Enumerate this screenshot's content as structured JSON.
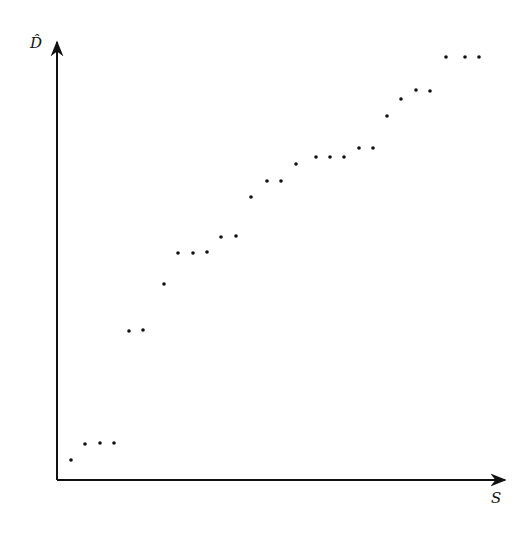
{
  "chart_data": {
    "type": "scatter",
    "title": "",
    "xlabel": "S",
    "ylabel": "D̂",
    "grid": false,
    "legend": null,
    "ticks": "none",
    "axis_pixel_frame": {
      "x0": 57,
      "y0": 480,
      "x_end": 507,
      "y_end": 40
    },
    "points_px": [
      [
        71,
        460
      ],
      [
        85,
        444
      ],
      [
        100,
        443
      ],
      [
        114,
        443
      ],
      [
        129,
        331
      ],
      [
        143,
        330
      ],
      [
        164,
        284
      ],
      [
        178,
        253
      ],
      [
        193,
        253
      ],
      [
        207,
        252
      ],
      [
        221,
        237
      ],
      [
        236,
        236
      ],
      [
        251,
        197
      ],
      [
        267,
        181
      ],
      [
        281,
        181
      ],
      [
        296,
        164
      ],
      [
        316,
        157
      ],
      [
        330,
        157
      ],
      [
        344,
        157
      ],
      [
        359,
        148
      ],
      [
        373,
        148
      ],
      [
        387,
        116
      ],
      [
        401,
        99
      ],
      [
        416,
        90
      ],
      [
        430,
        91
      ],
      [
        446,
        57
      ],
      [
        465,
        57
      ],
      [
        479,
        57
      ]
    ],
    "x": [
      1,
      2,
      3,
      4,
      5,
      6,
      7,
      8,
      9,
      10,
      11,
      12,
      13,
      14,
      15,
      16,
      17,
      18,
      19,
      20,
      21,
      22,
      23,
      24,
      25,
      26,
      27,
      28
    ],
    "y": [
      4.5,
      8.2,
      8.4,
      8.4,
      34.1,
      34.3,
      44.8,
      51.8,
      51.8,
      52.0,
      55.5,
      55.7,
      64.5,
      68.2,
      68.2,
      72.0,
      73.6,
      73.6,
      73.6,
      75.7,
      75.7,
      83.0,
      86.8,
      88.9,
      88.6,
      96.4,
      96.4,
      96.4
    ],
    "ylim": [
      0,
      100
    ],
    "point_color": "#111111",
    "axis_color": "#111111"
  }
}
